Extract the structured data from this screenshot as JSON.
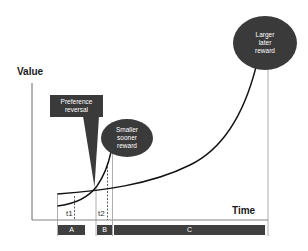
{
  "diagram": {
    "axes": {
      "y_label": "Value",
      "x_label": "Time"
    },
    "callouts": {
      "preference_reversal": {
        "line1": "Preference",
        "line2": "reversal"
      },
      "smaller_sooner": {
        "line1": "Smaller",
        "line2": "sooner",
        "line3": "reward"
      },
      "larger_later": {
        "line1": "Larger",
        "line2": "later",
        "line3": "reward"
      }
    },
    "time_markers": {
      "t1": "t1",
      "t2": "t2"
    },
    "phases": {
      "a": "A",
      "b": "B",
      "c": "C"
    },
    "colors": {
      "dark_fill": "#3a3a3a",
      "curve": "#111111",
      "guide_line": "#9a9a9a",
      "axis": "#555555",
      "background": "#ffffff"
    }
  }
}
